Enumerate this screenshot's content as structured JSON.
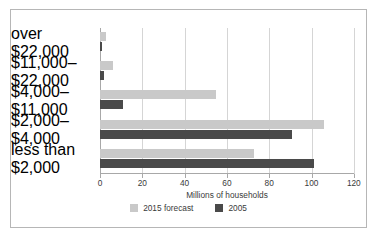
{
  "chart_data": {
    "type": "bar",
    "orientation": "horizontal",
    "title": "",
    "xlabel": "Millions of households",
    "ylabel": "",
    "xlim": [
      0,
      120
    ],
    "xticks": [
      0,
      20,
      40,
      60,
      80,
      100,
      120
    ],
    "grid": true,
    "legend_position": "bottom",
    "categories": [
      "over $22,000",
      "$11,000–$22,000",
      "$4,000–$11,000",
      "$2,000–$4,000",
      "less than $2,000"
    ],
    "series": [
      {
        "name": "2015 forecast",
        "color": "#c9c9c9",
        "values": [
          3,
          6,
          55,
          106,
          73
        ]
      },
      {
        "name": "2005",
        "color": "#4a4a4a",
        "values": [
          1,
          2,
          11,
          91,
          101
        ]
      }
    ]
  },
  "legend": {
    "items": [
      {
        "label": "2015 forecast",
        "color": "#c9c9c9"
      },
      {
        "label": "2005",
        "color": "#4a4a4a"
      }
    ]
  },
  "axis": {
    "x_label": "Millions of households",
    "tick_labels": [
      "0",
      "20",
      "40",
      "60",
      "80",
      "100",
      "120"
    ]
  },
  "colors": {
    "border": "#b6b6b6",
    "gridline": "#d5d5d5",
    "axis": "#a8a8a8",
    "text": "#3a3a3a",
    "background": "#ffffff"
  }
}
